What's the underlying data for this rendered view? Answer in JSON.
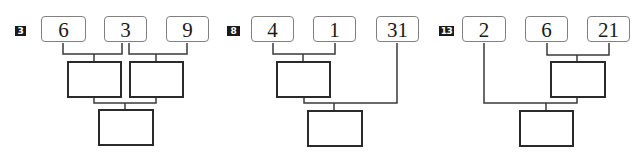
{
  "problems": [
    {
      "number": "3",
      "inputs": [
        "6",
        "3",
        "9"
      ],
      "structure": "pair(6,3) and pair(3,9) combine; results combine",
      "answer_boxes": 3
    },
    {
      "number": "8",
      "inputs": [
        "4",
        "1",
        "31"
      ],
      "structure": "pair(4,1) combines; result combines with 31",
      "answer_boxes": 2
    },
    {
      "number": "13",
      "inputs": [
        "2",
        "6",
        "21"
      ],
      "structure": "pair(6,21) combines; result combines with 2",
      "answer_boxes": 2
    }
  ],
  "colors": {
    "badge_bg": "#1a1a1a",
    "badge_text": "#ffffff",
    "input_border": "#808080",
    "answer_border": "#2a2a2a",
    "connector": "#3a3a3a"
  }
}
